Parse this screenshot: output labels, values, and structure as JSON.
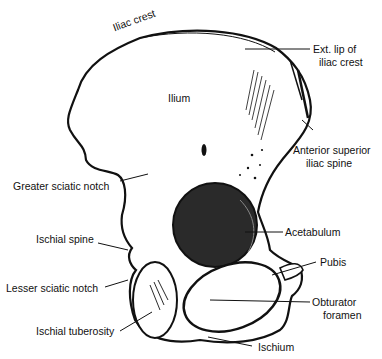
{
  "diagram": {
    "labels": {
      "iliac_crest": "Iliac crest",
      "ext_lip_line1": "Ext. lip of",
      "ext_lip_line2": "iliac crest",
      "ilium": "Ilium",
      "asis_line1": "Anterior superior",
      "asis_line2": "iliac spine",
      "greater_sciatic_notch": "Greater sciatic notch",
      "acetabulum": "Acetabulum",
      "ischial_spine": "Ischial spine",
      "pubis": "Pubis",
      "lesser_sciatic_notch": "Lesser sciatic notch",
      "obturator_line1": "Obturator",
      "obturator_line2": "foramen",
      "ischial_tuberosity": "Ischial tuberosity",
      "ischium": "Ischium"
    },
    "colors": {
      "ink": "#111111",
      "background": "#ffffff",
      "acetabulum_fill": "#2a2a2a"
    }
  }
}
